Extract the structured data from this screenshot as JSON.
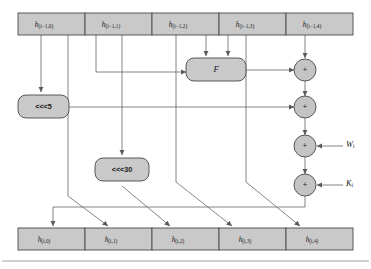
{
  "figure": {
    "colors": {
      "box_fill": "#c9c9c9",
      "box_stroke": "#4a4a4a",
      "wire": "#666666",
      "background": "#ffffff",
      "rule": "#8a8a8a"
    }
  },
  "input_registers": [
    {
      "name": "h-i-1-0",
      "base": "h",
      "sub": "(i−1,0)"
    },
    {
      "name": "h-i-1-1",
      "base": "h",
      "sub": "(i−1,1)"
    },
    {
      "name": "h-i-1-2",
      "base": "h",
      "sub": "(i−1,2)"
    },
    {
      "name": "h-i-1-3",
      "base": "h",
      "sub": "(i−1,3)"
    },
    {
      "name": "h-i-1-4",
      "base": "h",
      "sub": "(i−1,4)"
    }
  ],
  "output_registers": [
    {
      "name": "h-i-0",
      "base": "h",
      "sub": "(i,0)"
    },
    {
      "name": "h-i-1",
      "base": "h",
      "sub": "(i,1)"
    },
    {
      "name": "h-i-2",
      "base": "h",
      "sub": "(i,2)"
    },
    {
      "name": "h-i-3",
      "base": "h",
      "sub": "(i,3)"
    },
    {
      "name": "h-i-4",
      "base": "h",
      "sub": "(i,4)"
    }
  ],
  "operators": {
    "rotate_left_5": "<<<5",
    "rotate_left_30": "<<<30",
    "function_box": "F",
    "adder_symbol": "+"
  },
  "adders": [
    {
      "name": "adder-f",
      "symbol": "+"
    },
    {
      "name": "adder-rot5",
      "symbol": "+"
    },
    {
      "name": "adder-w",
      "symbol": "+"
    },
    {
      "name": "adder-k",
      "symbol": "+"
    }
  ],
  "constants": [
    {
      "name": "word-input",
      "base": "W",
      "sub": "i"
    },
    {
      "name": "round-constant",
      "base": "K",
      "sub": "i"
    }
  ]
}
